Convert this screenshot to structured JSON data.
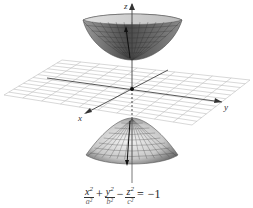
{
  "figure": {
    "axes": {
      "x_label": "x",
      "y_label": "y",
      "z_label": "z"
    },
    "equation": {
      "terms": [
        {
          "numerator": "x",
          "exponent": "2",
          "denominator": "a²"
        },
        {
          "numerator": "y",
          "exponent": "2",
          "denominator": "b²"
        },
        {
          "numerator": "z",
          "exponent": "2",
          "denominator": "c²"
        }
      ],
      "operators": [
        "+",
        "−",
        "="
      ],
      "rhs": "−1"
    },
    "colors": {
      "surface_dark": "#4a4a4a",
      "surface_light": "#d8d8d8",
      "grid": "#bdbdbd",
      "axis": "#333333"
    }
  }
}
